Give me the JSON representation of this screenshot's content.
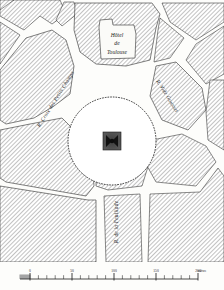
{
  "map": {
    "kind": "antique-engraved-city-plan",
    "subject": "Place des Victoires",
    "orientation": "north-up",
    "ink_color": "#1a1a1a",
    "paper_color": "#fdfdfb",
    "block_hatch_color": "#8d8d8d",
    "street_fill": "#ffffff",
    "labels": {
      "hotel_line1": "Hôtel",
      "hotel_line2": "de",
      "hotel_line3": "Toulouse",
      "street_left": "R. Croix des Petits Champs",
      "street_right": "R. Vide Gousset",
      "street_bottom": "R. de la Feuillade"
    },
    "monument": {
      "name": "equestrian-statue",
      "shape": "square-pedestal-with-star"
    },
    "plaza": {
      "name": "circular-place",
      "shape": "circle"
    }
  },
  "scale_bar": {
    "unit_label": "mètres",
    "ticks": [
      "0",
      "50",
      "100",
      "150",
      "200"
    ],
    "minor_divisions": 20,
    "zero_label": "0"
  },
  "chart_data": {
    "type": "table",
    "categories": [
      "Hôtel de Toulouse",
      "Circular place",
      "Equestrian statue",
      "R. Croix des Petits Champs",
      "R. Vide Gousset",
      "R. de la Feuillade"
    ],
    "values": [
      1,
      1,
      1,
      1,
      1,
      1
    ]
  }
}
